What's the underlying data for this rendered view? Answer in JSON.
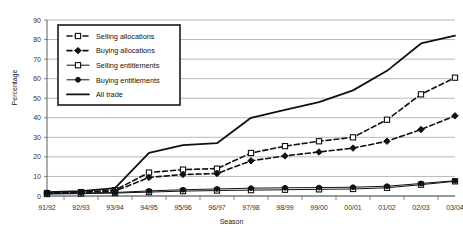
{
  "chart_data": {
    "type": "line",
    "title": "",
    "xlabel": "Season",
    "ylabel": "Percentage",
    "ylim": [
      0,
      90
    ],
    "ytick_step": 10,
    "grid": true,
    "legend_position": "top-left-inside",
    "categories": [
      "91/92",
      "92/93",
      "93/94",
      "94/95",
      "95/96",
      "96/97",
      "97/98",
      "98/99",
      "99/00",
      "00/01",
      "01/02",
      "02/03",
      "03/04"
    ],
    "yticks": [
      "0",
      "10",
      "20",
      "30",
      "40",
      "50",
      "60",
      "70",
      "80",
      "90"
    ],
    "series": [
      {
        "name": "Selling allocations",
        "style": "dashed",
        "marker": "open-square",
        "values": [
          1.5,
          2.0,
          3.0,
          12.0,
          13.5,
          14.0,
          22.0,
          25.5,
          28.0,
          30.0,
          39.0,
          52.0,
          60.5
        ]
      },
      {
        "name": "Buying allocations",
        "style": "dashed",
        "marker": "solid-diamond",
        "values": [
          1.5,
          1.8,
          2.5,
          9.5,
          11.0,
          11.5,
          18.0,
          20.5,
          22.5,
          24.5,
          28.0,
          34.0,
          41.0
        ]
      },
      {
        "name": "Selling entitlements",
        "style": "solid-thin",
        "marker": "open-square",
        "values": [
          1.0,
          1.2,
          1.5,
          2.0,
          2.5,
          2.8,
          3.0,
          3.2,
          3.4,
          3.6,
          4.2,
          5.8,
          7.5
        ]
      },
      {
        "name": "Buying entitlements",
        "style": "solid-thin",
        "marker": "solid-circle",
        "values": [
          1.2,
          1.5,
          1.8,
          2.6,
          3.2,
          3.6,
          4.0,
          4.2,
          4.3,
          4.5,
          5.0,
          6.4,
          7.8
        ]
      },
      {
        "name": "All trade",
        "style": "solid-thick",
        "marker": "none",
        "values": [
          2.0,
          2.5,
          4.0,
          22.0,
          26.0,
          27.0,
          40.0,
          44.0,
          48.0,
          54.0,
          64.0,
          78.0,
          82.0
        ]
      }
    ]
  },
  "legend": {
    "items": [
      {
        "label": "Selling allocations"
      },
      {
        "label": "Buying allocations"
      },
      {
        "label": "Selling entitlements"
      },
      {
        "label": "Buying entitlements"
      },
      {
        "label": "All trade"
      }
    ]
  }
}
